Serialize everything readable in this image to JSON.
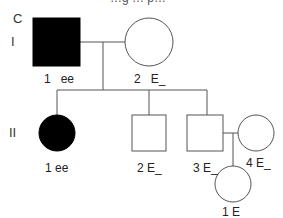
{
  "figure": {
    "panel_label": "C",
    "cut_off_title": "…g … p…",
    "generations": [
      "I",
      "II"
    ],
    "individuals": {
      "I_1": {
        "number": "1",
        "genotype": "ee",
        "sex": "male",
        "affected": true
      },
      "I_2": {
        "number": "2",
        "genotype": "E_",
        "sex": "female",
        "affected": false
      },
      "II_1": {
        "number": "1",
        "genotype": "ee",
        "sex": "female",
        "affected": true
      },
      "II_2": {
        "number": "2",
        "genotype": "E_",
        "sex": "male",
        "affected": false
      },
      "II_3": {
        "number": "3",
        "genotype": "E_",
        "sex": "male",
        "affected": false
      },
      "II_4": {
        "number": "4",
        "genotype": "E_",
        "sex": "female",
        "affected": false
      },
      "III_1": {
        "number": "1",
        "genotype": "E_",
        "sex": "female",
        "affected": false
      }
    },
    "labels": {
      "I_1": "1   ee",
      "I_2": "2   E_",
      "II_1": "1 ee",
      "II_2": "2 E_",
      "II_3": "3 E_",
      "II_4": "4 E_",
      "III_1": "1 E_"
    },
    "colors": {
      "affected": "#000000",
      "unaffected": "#ffffff",
      "line": "#555555"
    }
  }
}
